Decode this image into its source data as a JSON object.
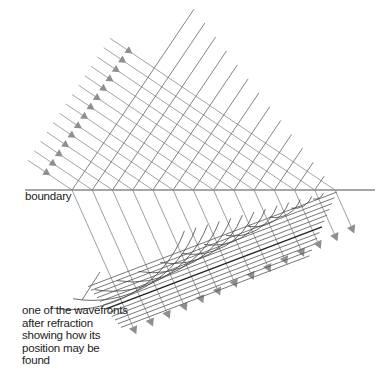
{
  "diagram": {
    "labels": {
      "boundary": "boundary",
      "wavefront_annotation": [
        "one of the wavefronts",
        "after refraction",
        "showing how its",
        "position may be",
        "found"
      ]
    },
    "colors": {
      "rays": "#9a9a9a",
      "arrowheads": "#8f8f8f",
      "wavefronts": "#555555",
      "boundary": "#888888",
      "construction_arcs": "#444444",
      "text": "#222222"
    },
    "geometry": {
      "boundary": {
        "x1": 25,
        "y1": 190,
        "x2": 375,
        "y2": 190
      },
      "incident_ray_count": 14,
      "refracted_ray_count": 14,
      "incident_direction": "down-right (~35° below horizontal)",
      "refracted_direction": "steeper, towards the normal"
    }
  }
}
